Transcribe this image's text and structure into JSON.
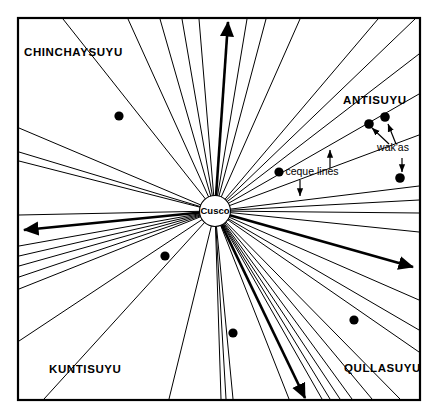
{
  "figure": {
    "type": "radial-diagram",
    "background_color": "#ffffff",
    "line_color": "#000000",
    "frame": {
      "x": 18,
      "y": 18,
      "width": 402,
      "height": 382,
      "stroke_width": 2.2
    }
  },
  "center": {
    "label": "Cusco",
    "x": 215,
    "y": 211,
    "radius": 15.5
  },
  "quadrants": [
    {
      "id": "chinchaysuyu",
      "label": "CHINCHAYSUYU",
      "x": 24,
      "y": 56,
      "anchor": "start"
    },
    {
      "id": "antisuyu",
      "label": "ANTISUYU",
      "x": 343,
      "y": 104,
      "anchor": "start"
    },
    {
      "id": "kuntisuyu",
      "label": "KUNTISUYU",
      "x": 49,
      "y": 373,
      "anchor": "start"
    },
    {
      "id": "qullasuyu",
      "label": "QULLASUYU",
      "x": 344,
      "y": 372,
      "anchor": "start"
    }
  ],
  "annotations": [
    {
      "id": "ceque-lines",
      "label": "ceque lines",
      "x": 312,
      "y": 175,
      "anchor": "middle",
      "arrows": [
        {
          "from_x": 330,
          "from_y": 168,
          "to_x": 330,
          "to_y": 150
        },
        {
          "from_x": 300,
          "from_y": 180,
          "to_x": 300,
          "to_y": 196
        }
      ]
    },
    {
      "id": "wakas",
      "label": "wak'as",
      "x": 393,
      "y": 151,
      "anchor": "middle",
      "arrows": [
        {
          "from_x": 389,
          "from_y": 144,
          "to_x": 372,
          "to_y": 128
        },
        {
          "from_x": 396,
          "from_y": 144,
          "to_x": 388,
          "to_y": 124
        },
        {
          "from_x": 402,
          "from_y": 158,
          "to_x": 402,
          "to_y": 172
        }
      ]
    }
  ],
  "wakas_dots": [
    {
      "x": 119,
      "y": 116,
      "r": 4.6
    },
    {
      "x": 279,
      "y": 172,
      "r": 4.6
    },
    {
      "x": 369,
      "y": 124,
      "r": 4.8
    },
    {
      "x": 385,
      "y": 117,
      "r": 4.8
    },
    {
      "x": 400,
      "y": 178,
      "r": 4.8
    },
    {
      "x": 165,
      "y": 256,
      "r": 4.6
    },
    {
      "x": 233,
      "y": 333,
      "r": 4.6
    },
    {
      "x": 354,
      "y": 320,
      "r": 4.6
    }
  ],
  "highlighted_rays": [
    {
      "id": "ray-north",
      "end_x": 228,
      "end_y": 22,
      "stroke_width": 2.6,
      "arrow": true
    },
    {
      "id": "ray-west",
      "end_x": 24,
      "end_y": 230,
      "stroke_width": 2.6,
      "arrow": true
    },
    {
      "id": "ray-east",
      "end_x": 413,
      "end_y": 267,
      "stroke_width": 2.6,
      "arrow": true
    },
    {
      "id": "ray-south",
      "end_x": 305,
      "end_y": 398,
      "stroke_width": 2.6,
      "arrow": true
    }
  ],
  "ceque_rays": [
    {
      "end_x": 63,
      "end_y": 19,
      "w": 1.0
    },
    {
      "end_x": 128,
      "end_y": 19,
      "w": 1.0
    },
    {
      "end_x": 160,
      "end_y": 19,
      "w": 1.0
    },
    {
      "end_x": 182,
      "end_y": 19,
      "w": 1.0
    },
    {
      "end_x": 199,
      "end_y": 19,
      "w": 1.0
    },
    {
      "end_x": 247,
      "end_y": 19,
      "w": 1.0
    },
    {
      "end_x": 266,
      "end_y": 19,
      "w": 1.0
    },
    {
      "end_x": 300,
      "end_y": 19,
      "w": 1.0
    },
    {
      "end_x": 378,
      "end_y": 19,
      "w": 1.0
    },
    {
      "end_x": 415,
      "end_y": 19,
      "w": 1.0
    },
    {
      "end_x": 419,
      "end_y": 54,
      "w": 1.0
    },
    {
      "end_x": 419,
      "end_y": 94,
      "w": 1.0
    },
    {
      "end_x": 419,
      "end_y": 135,
      "w": 1.0
    },
    {
      "end_x": 419,
      "end_y": 186,
      "w": 1.0
    },
    {
      "end_x": 419,
      "end_y": 200,
      "w": 1.0
    },
    {
      "end_x": 419,
      "end_y": 213,
      "w": 1.0
    },
    {
      "end_x": 419,
      "end_y": 232,
      "w": 1.0
    },
    {
      "end_x": 419,
      "end_y": 300,
      "w": 1.0
    },
    {
      "end_x": 419,
      "end_y": 330,
      "w": 1.0
    },
    {
      "end_x": 419,
      "end_y": 352,
      "w": 1.0
    },
    {
      "end_x": 400,
      "end_y": 399,
      "w": 1.0
    },
    {
      "end_x": 372,
      "end_y": 399,
      "w": 1.0
    },
    {
      "end_x": 352,
      "end_y": 399,
      "w": 1.0
    },
    {
      "end_x": 340,
      "end_y": 399,
      "w": 1.0
    },
    {
      "end_x": 330,
      "end_y": 399,
      "w": 1.0
    },
    {
      "end_x": 322,
      "end_y": 399,
      "w": 1.0
    },
    {
      "end_x": 289,
      "end_y": 399,
      "w": 1.0
    },
    {
      "end_x": 233,
      "end_y": 399,
      "w": 1.0
    },
    {
      "end_x": 226,
      "end_y": 399,
      "w": 1.0
    },
    {
      "end_x": 221,
      "end_y": 399,
      "w": 1.0
    },
    {
      "end_x": 169,
      "end_y": 399,
      "w": 1.0
    },
    {
      "end_x": 44,
      "end_y": 399,
      "w": 1.0
    },
    {
      "end_x": 19,
      "end_y": 341,
      "w": 1.0
    },
    {
      "end_x": 19,
      "end_y": 289,
      "w": 1.0
    },
    {
      "end_x": 19,
      "end_y": 277,
      "w": 1.0
    },
    {
      "end_x": 19,
      "end_y": 266,
      "w": 1.0
    },
    {
      "end_x": 19,
      "end_y": 256,
      "w": 1.0
    },
    {
      "end_x": 19,
      "end_y": 246,
      "w": 1.0
    },
    {
      "end_x": 19,
      "end_y": 215,
      "w": 1.0
    },
    {
      "end_x": 19,
      "end_y": 161,
      "w": 1.0
    },
    {
      "end_x": 19,
      "end_y": 152,
      "w": 1.0
    },
    {
      "end_x": 19,
      "end_y": 128,
      "w": 1.0
    }
  ]
}
